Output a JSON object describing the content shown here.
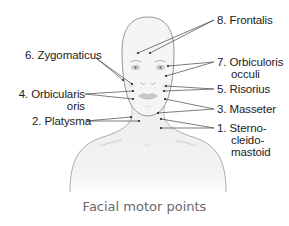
{
  "figure": {
    "caption": "Facial motor points",
    "colors": {
      "outline": "#8a8a8a",
      "leader_line": "#444444",
      "point": "#222222",
      "label_text": "#222222",
      "caption_text": "#6a6a6a",
      "skin_fill": "#f4f4f4",
      "body_fill": "#ededed"
    },
    "labels_right": [
      {
        "id": "frontalis",
        "number": "8.",
        "line1": "8. Frontalis",
        "line2": "",
        "line3": ""
      },
      {
        "id": "orbicularis-oculi",
        "number": "7.",
        "line1": "7. Orbiculoris",
        "line2": "occuli",
        "line3": ""
      },
      {
        "id": "risorius",
        "number": "5.",
        "line1": "5. Risorius",
        "line2": "",
        "line3": ""
      },
      {
        "id": "masseter",
        "number": "3.",
        "line1": "3. Masseter",
        "line2": "",
        "line3": ""
      },
      {
        "id": "sternocleidomastoid",
        "number": "1.",
        "line1": "1. Sterno-",
        "line2": "cleido-",
        "line3": "mastoid"
      }
    ],
    "labels_left": [
      {
        "id": "zygomaticus",
        "number": "6.",
        "line1": "6. Zygomaticus",
        "line2": ""
      },
      {
        "id": "orbicularis-oris",
        "number": "4.",
        "line1": "4. Orbicularis",
        "line2": "oris"
      },
      {
        "id": "platysma",
        "number": "2.",
        "line1": "2. Platysma",
        "line2": ""
      }
    ]
  }
}
